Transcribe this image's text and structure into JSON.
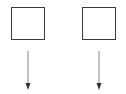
{
  "diagram": {
    "nodes": [
      {
        "id": "box-left",
        "label": "",
        "x": 11,
        "y": 7,
        "w": 34,
        "h": 33
      },
      {
        "id": "box-right",
        "label": "",
        "x": 82,
        "y": 7,
        "w": 34,
        "h": 33
      }
    ],
    "arrows": [
      {
        "id": "arrow-left",
        "direction": "down",
        "x": 28,
        "y1": 51,
        "y2": 89
      },
      {
        "id": "arrow-right",
        "direction": "down",
        "x": 99,
        "y1": 51,
        "y2": 89
      }
    ],
    "colors": {
      "box_border": "#3a3a3a",
      "arrow_line": "#9a9a9a",
      "arrow_head": "#333333",
      "background": "#ffffff"
    }
  }
}
